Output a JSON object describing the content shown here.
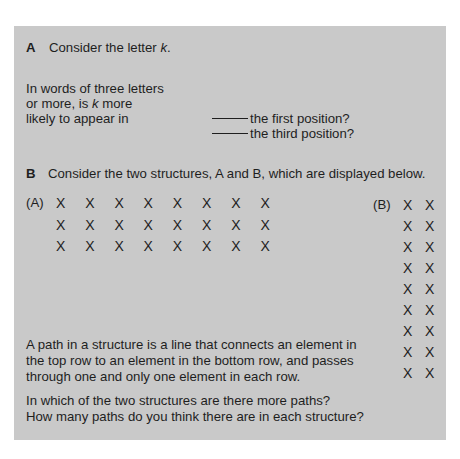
{
  "section_a": {
    "label": "A",
    "intro_prefix": "Consider the letter ",
    "intro_letter": "k",
    "intro_suffix": ".",
    "question_lines": [
      "In words of three letters",
      "or more, is ",
      "k",
      " more",
      "likely to appear in"
    ],
    "options": [
      "the first position?",
      "the third position?"
    ]
  },
  "section_b": {
    "label": "B",
    "intro": "Consider the two structures, A and B, which are displayed below.",
    "structure_a": {
      "label": "(A)",
      "rows": 3,
      "cols": 8,
      "glyph": "X"
    },
    "structure_b": {
      "label": "(B)",
      "rows": 9,
      "cols": 2,
      "glyph": "X"
    },
    "definition_lines": [
      "A path in a structure is a line that connects an element in",
      "the top row to  an element in the bottom row, and passes",
      "through one and only one element in each row."
    ],
    "question_lines": [
      "In which of the two structures are there more paths?",
      "How many paths do you think there are in each structure?"
    ]
  },
  "colors": {
    "panel_bg": "#c9c9c9",
    "text": "#1e1e1e",
    "page_bg": "#ffffff"
  }
}
